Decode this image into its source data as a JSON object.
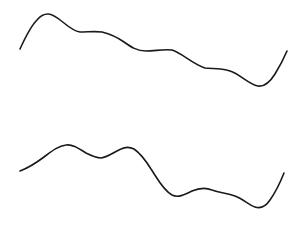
{
  "canvas": {
    "width": 301,
    "height": 229,
    "background": "#ffffff"
  },
  "curves": [
    {
      "id": "top-curve",
      "stroke": "#1a1a1a",
      "path": "M20,49 C25,38 31,26 37,20 C41,15 44,14 48,14 C53,14 58,18 64,23 C70,28 74,31 80,32 C88,32 95,31 102,32 C110,34 117,37 124,42 C131,47 137,51 146,51 C155,51 163,49 172,50 C182,53 191,63 205,68 C212,69 220,68 230,71 C240,74 248,84 258,86 C264,87 270,82 275,74 C280,66 284,58 287,51"
    },
    {
      "id": "bottom-curve",
      "stroke": "#1a1a1a",
      "path": "M20,171 C28,168 36,163 44,157 C52,151 58,146 66,145 C72,144 78,148 86,153 C92,156 96,158 101,158 C108,157 114,152 121,149 C125,147 130,147 134,149 C140,153 146,161 151,169 C157,178 163,190 172,195 C178,198 184,195 192,191 C199,188 205,187 212,190 C220,193 227,193 235,196 C243,199 249,205 255,207 C261,209 266,206 270,200 C275,193 280,183 284,173"
    }
  ]
}
